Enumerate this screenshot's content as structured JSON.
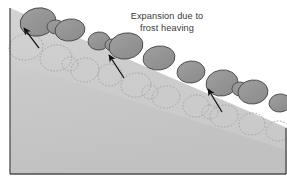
{
  "figure": {
    "kind": "geology-cross-section-diagram",
    "title": "Expansion due to frost heaving",
    "width": 287,
    "height": 180,
    "background_color": "#ffffff"
  },
  "caption": {
    "line1": "Expansion due to",
    "line2": "frost heaving",
    "x": 167,
    "line1_y": 19,
    "line2_y": 31,
    "color": "#3a3a3a"
  },
  "colors": {
    "background": "#ffffff",
    "ground_light": "#d2d2d2",
    "ground_shade": "#c6c6c6",
    "ground_deep": "#c0c0c0",
    "stone_fill": "#949494",
    "stone_stroke": "#4a4a4a",
    "ghost_stroke": "#a0a0a0",
    "arrow_color": "#101010",
    "border_color": "#4d4d4d"
  },
  "ground": {
    "label": "hillside-slope-cross-section",
    "outline_points": "10,8 287,128 287,174 10,174",
    "surface_line": "10,8 287,128",
    "base_line_y": 174,
    "left_edge_x": 10
  },
  "heaved_stones": {
    "label": "heaved-stones-surface-layer",
    "count": 12,
    "fill": "#949494",
    "stroke": "#4a4a4a",
    "items": [
      {
        "name": "stone-1",
        "cx": 38,
        "cy": 22,
        "rx": 18,
        "ry": 14,
        "rot": -12
      },
      {
        "name": "stone-2",
        "cx": 70,
        "cy": 30,
        "rx": 15,
        "ry": 11,
        "rot": -8
      },
      {
        "name": "stone-3",
        "cx": 99,
        "cy": 41,
        "rx": 11,
        "ry": 9,
        "rot": -6
      },
      {
        "name": "stone-4",
        "cx": 126,
        "cy": 46,
        "rx": 17,
        "ry": 13,
        "rot": -10
      },
      {
        "name": "stone-5",
        "cx": 159,
        "cy": 58,
        "rx": 16,
        "ry": 12,
        "rot": -8
      },
      {
        "name": "stone-6",
        "cx": 191,
        "cy": 72,
        "rx": 14,
        "ry": 11,
        "rot": -6
      },
      {
        "name": "stone-7",
        "cx": 222,
        "cy": 83,
        "rx": 16,
        "ry": 13,
        "rot": -9
      },
      {
        "name": "stone-8",
        "cx": 253,
        "cy": 92,
        "rx": 15,
        "ry": 12,
        "rot": -7
      },
      {
        "name": "stone-9",
        "cx": 280,
        "cy": 103,
        "rx": 11,
        "ry": 9,
        "rot": -6
      },
      {
        "name": "stone-10",
        "cx": 56,
        "cy": 27,
        "rx": 9,
        "ry": 7,
        "rot": 4
      },
      {
        "name": "stone-11",
        "cx": 112,
        "cy": 45,
        "rx": 7,
        "ry": 6,
        "rot": 3
      },
      {
        "name": "stone-12",
        "cx": 240,
        "cy": 89,
        "rx": 8,
        "ry": 7,
        "rot": 2
      }
    ]
  },
  "ghost_stones": {
    "label": "original-stone-positions-dotted",
    "count": 13,
    "stroke": "#a0a0a0",
    "dash": "1.6 1.6",
    "items": [
      {
        "name": "ghost-1",
        "cx": 26,
        "cy": 47,
        "rx": 17,
        "ry": 13,
        "rot": -10
      },
      {
        "name": "ghost-2",
        "cx": 56,
        "cy": 58,
        "rx": 16,
        "ry": 13,
        "rot": -8
      },
      {
        "name": "ghost-3",
        "cx": 85,
        "cy": 70,
        "rx": 14,
        "ry": 12,
        "rot": -8
      },
      {
        "name": "ghost-4",
        "cx": 110,
        "cy": 75,
        "rx": 12,
        "ry": 11,
        "rot": -6
      },
      {
        "name": "ghost-5",
        "cx": 136,
        "cy": 85,
        "rx": 15,
        "ry": 12,
        "rot": -8
      },
      {
        "name": "ghost-6",
        "cx": 166,
        "cy": 97,
        "rx": 14,
        "ry": 11,
        "rot": -7
      },
      {
        "name": "ghost-7",
        "cx": 196,
        "cy": 106,
        "rx": 13,
        "ry": 11,
        "rot": -6
      },
      {
        "name": "ghost-8",
        "cx": 224,
        "cy": 116,
        "rx": 14,
        "ry": 11,
        "rot": -6
      },
      {
        "name": "ghost-9",
        "cx": 252,
        "cy": 124,
        "rx": 13,
        "ry": 11,
        "rot": -5
      },
      {
        "name": "ghost-10",
        "cx": 278,
        "cy": 131,
        "rx": 12,
        "ry": 10,
        "rot": -4
      },
      {
        "name": "ghost-11",
        "cx": 70,
        "cy": 64,
        "rx": 8,
        "ry": 7,
        "rot": 3
      },
      {
        "name": "ghost-12",
        "cx": 150,
        "cy": 92,
        "rx": 8,
        "ry": 7,
        "rot": 2
      },
      {
        "name": "ghost-13",
        "cx": 210,
        "cy": 112,
        "rx": 8,
        "ry": 7,
        "rot": 2
      }
    ]
  },
  "arrows": {
    "label": "heave-direction-arrows",
    "count": 3,
    "color": "#101010",
    "direction": "up-left",
    "items": [
      {
        "name": "arrow-1",
        "x1": 39,
        "y1": 48,
        "x2": 24,
        "y2": 28
      },
      {
        "name": "arrow-2",
        "x1": 124,
        "y1": 78,
        "x2": 109,
        "y2": 55
      },
      {
        "name": "arrow-3",
        "x1": 222,
        "y1": 112,
        "x2": 208,
        "y2": 89
      }
    ]
  },
  "border": {
    "label": "figure-border-edges",
    "color": "#4d4d4d",
    "left_x": 10,
    "right_x": 286,
    "bottom_y": 174
  }
}
